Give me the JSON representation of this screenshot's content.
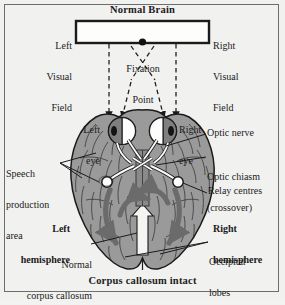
{
  "figure": {
    "title": "Normal Brain",
    "caption": "Corpus callosum intact",
    "view": "inferior (ventral) view of the human brain showing the visual pathway",
    "colors": {
      "background": "#f1f1ef",
      "brain_fill": "#9a9a9a",
      "brain_outline": "#1b1b1b",
      "pathway_arrow": "#6b6b6b",
      "corpus_callosum": "#f4f4f2",
      "text": "#1b1b1b",
      "frame": "#6d6d6d"
    }
  },
  "visual_field": {
    "bar_label": "visual-field-bar",
    "left": "Left\nVisual\nField",
    "left_lines": [
      "Left",
      "Visual",
      "Field"
    ],
    "right": "Right\nVisual\nField",
    "right_lines": [
      "Right",
      "Visual",
      "Field"
    ],
    "fixation_point": "Fixation\nPoint",
    "fixation_lines": [
      "Fixation",
      "Point"
    ]
  },
  "eyes": {
    "left": "Left\neye",
    "left_lines": [
      "Left",
      "eye"
    ],
    "right": "Right\neye",
    "right_lines": [
      "Right",
      "eye"
    ]
  },
  "labels": {
    "optic_nerve": "Optic nerve",
    "optic_chiasm": "Optic chiasm",
    "optic_chiasm_sub": "(crossover)",
    "relay_centres": "Relay centres",
    "speech_area": "Speech\nproduction\narea",
    "speech_area_lines": [
      "Speech",
      "production",
      "area"
    ],
    "left_hemisphere": "Left\nhemisphere",
    "left_hemisphere_lines": [
      "Left",
      "hemisphere"
    ],
    "right_hemisphere": "Right\nhemisphere",
    "right_hemisphere_lines": [
      "Right",
      "hemisphere"
    ],
    "corpus_callosum": "Normal\ncorpus callosum",
    "corpus_callosum_lines": [
      "Normal",
      "corpus callosum"
    ],
    "occipital_lobes": "Occipital\nlobes",
    "occipital_lobes_lines": [
      "Occipital",
      "lobes"
    ]
  }
}
